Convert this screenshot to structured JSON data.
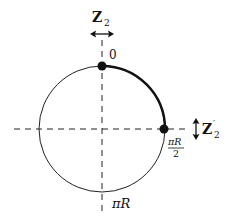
{
  "diagram": {
    "type": "orbifold-circle",
    "colors": {
      "stroke": "#111111",
      "background": "#ffffff"
    },
    "labels": {
      "z2_top": {
        "main": "Z",
        "sub": "2"
      },
      "zero": "0",
      "pi_r_half_num": "πR",
      "pi_r_half_den": "2",
      "z2_prime": {
        "main": "Z",
        "prime": "′",
        "sub": "2"
      },
      "pi_r": "πR"
    },
    "points": [
      {
        "name": "fixed-point-0",
        "label": "0"
      },
      {
        "name": "fixed-point-pi-r-half",
        "label": "πR/2"
      }
    ],
    "highlighted_arc": {
      "from": "0",
      "to": "πR/2"
    }
  }
}
